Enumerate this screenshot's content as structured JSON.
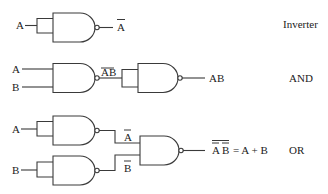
{
  "diagram": {
    "rows": [
      {
        "id": "inverter",
        "name": "Inverter",
        "inputs": [
          "A"
        ],
        "output_label": "A",
        "output_overbar": true
      },
      {
        "id": "and",
        "name": "AND",
        "inputs": [
          "A",
          "B"
        ],
        "intermediate_label": "AB",
        "intermediate_overbar": true,
        "output_label": "AB",
        "output_overbar": false
      },
      {
        "id": "or",
        "name": "OR",
        "inputs": [
          "A",
          "B"
        ],
        "intermediate_labels": [
          "A",
          "B"
        ],
        "intermediate_overbar": true,
        "output_label_left_a": "A",
        "output_label_left_b": "B",
        "output_label_right": "= A + B",
        "output_overbar": "double"
      }
    ],
    "colors": {
      "line": "#3a3a3a",
      "text": "#222222",
      "background": "#ffffff"
    }
  }
}
